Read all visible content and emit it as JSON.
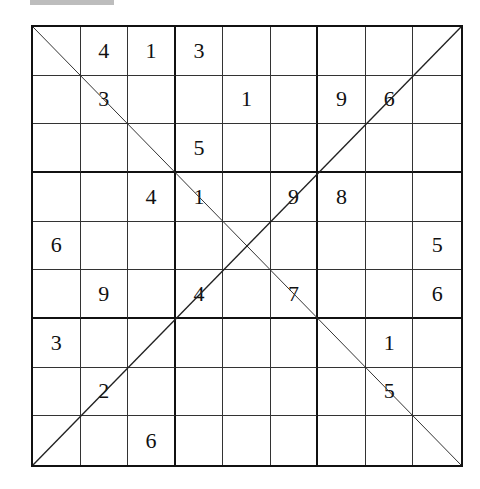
{
  "puzzle": {
    "type": "X-Sudoku",
    "size": 9,
    "box_size": 3,
    "diagonals": [
      "top-left-to-bottom-right",
      "bottom-left-to-top-right"
    ],
    "grid": [
      [
        "",
        "4",
        "1",
        "3",
        "",
        "",
        "",
        "",
        ""
      ],
      [
        "",
        "3",
        "",
        "",
        "1",
        "",
        "9",
        "6",
        ""
      ],
      [
        "",
        "",
        "",
        "5",
        "",
        "",
        "",
        "",
        ""
      ],
      [
        "",
        "",
        "4",
        "1",
        "",
        "9",
        "8",
        "",
        ""
      ],
      [
        "6",
        "",
        "",
        "",
        "",
        "",
        "",
        "",
        "5"
      ],
      [
        "",
        "9",
        "",
        "4",
        "",
        "7",
        "",
        "",
        "6"
      ],
      [
        "3",
        "",
        "",
        "",
        "",
        "",
        "",
        "1",
        ""
      ],
      [
        "",
        "2",
        "",
        "",
        "",
        "",
        "",
        "5",
        ""
      ],
      [
        "",
        "",
        "6",
        "",
        "",
        "",
        "",
        "",
        ""
      ]
    ]
  },
  "colors": {
    "grid_line": "#333333",
    "box_line": "#111111",
    "digit": "#111111",
    "top_bar": "#bdbdbd",
    "background": "#ffffff"
  }
}
